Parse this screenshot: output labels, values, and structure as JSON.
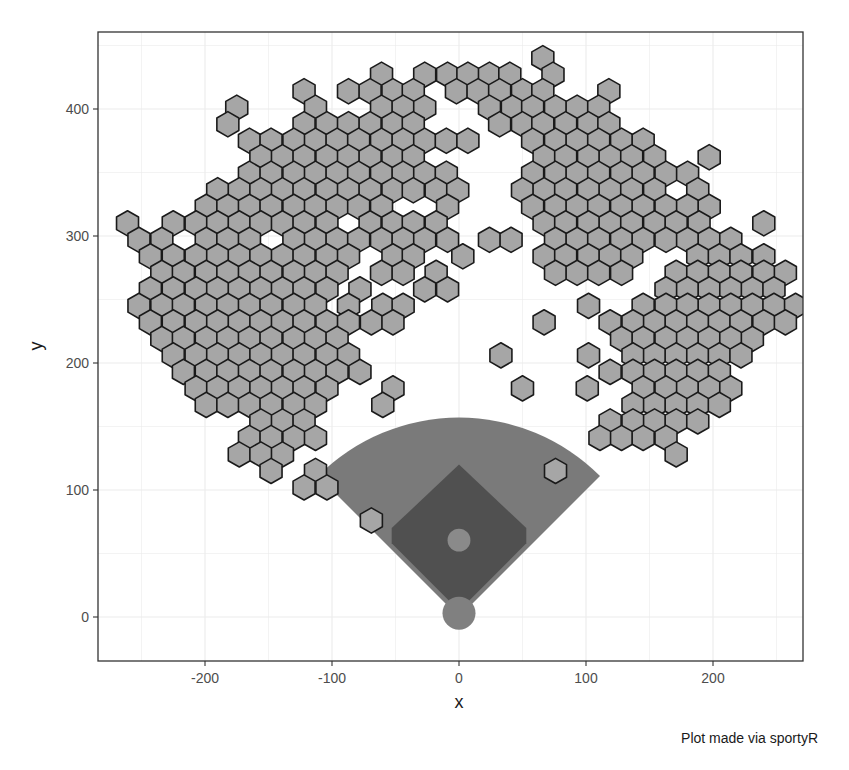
{
  "chart_data": {
    "type": "heatmap",
    "subtype": "hexbin-spray-chart",
    "title": "",
    "xlabel": "x",
    "ylabel": "y",
    "caption": "Plot made via sportyR",
    "xlim": [
      -280,
      275
    ],
    "ylim": [
      -33,
      462
    ],
    "x_ticks": [
      -200,
      -100,
      0,
      100,
      200
    ],
    "x_tick_labels": [
      "-200",
      "-100",
      "0",
      "100",
      "200"
    ],
    "y_ticks": [
      0,
      100,
      200,
      300,
      400
    ],
    "y_tick_labels": [
      "0",
      "100",
      "200",
      "300",
      "400"
    ],
    "grid": true,
    "legend": "none",
    "hex_fill": "#a6a6a6",
    "hex_stroke": "#1a1a1a",
    "field": {
      "outfield_grass_color": "#7a7a7a",
      "infield_dirt_color": "#505050",
      "mound_color": "#8a8a8a",
      "home_plate_circle_color": "#808080"
    },
    "hex_rows": [
      {
        "y": 440,
        "x": [
          66
        ]
      },
      {
        "y": 427,
        "x": [
          -61,
          -27,
          -9,
          7,
          24,
          40,
          74
        ]
      },
      {
        "y": 414,
        "x": [
          -122,
          -87,
          -70,
          -52,
          -36,
          -2,
          15,
          32,
          50,
          66,
          118
        ]
      },
      {
        "y": 401,
        "x": [
          -175,
          -113,
          -61,
          -44,
          -27,
          24,
          42,
          58,
          76,
          93,
          110
        ]
      },
      {
        "y": 388,
        "x": [
          -182,
          -122,
          -104,
          -87,
          -70,
          -52,
          -36,
          32,
          50,
          66,
          84,
          102,
          118
        ]
      },
      {
        "y": 375,
        "x": [
          -165,
          -148,
          -130,
          -113,
          -96,
          -79,
          -61,
          -44,
          -27,
          -10,
          7,
          58,
          76,
          93,
          110,
          128,
          145
        ]
      },
      {
        "y": 362,
        "x": [
          -156,
          -139,
          -122,
          -104,
          -87,
          -70,
          -52,
          -36,
          67,
          84,
          102,
          119,
          136,
          154,
          197
        ]
      },
      {
        "y": 349,
        "x": [
          -165,
          -148,
          -130,
          -113,
          -96,
          -79,
          -61,
          -44,
          -27,
          -10,
          58,
          76,
          93,
          110,
          128,
          145,
          163,
          180
        ]
      },
      {
        "y": 336,
        "x": [
          -190,
          -173,
          -156,
          -139,
          -122,
          -104,
          -87,
          -70,
          -52,
          -36,
          -18,
          -1,
          50,
          67,
          84,
          102,
          119,
          136,
          154,
          188
        ]
      },
      {
        "y": 323,
        "x": [
          -199,
          -182,
          -165,
          -148,
          -130,
          -113,
          -96,
          -79,
          -61,
          -9,
          58,
          76,
          93,
          110,
          128,
          145,
          163,
          180,
          197
        ]
      },
      {
        "y": 310,
        "x": [
          -261,
          -225,
          -207,
          -190,
          -173,
          -156,
          -139,
          -122,
          -104,
          -70,
          -52,
          -36,
          -18,
          67,
          84,
          102,
          119,
          136,
          154,
          171,
          189,
          240
        ]
      },
      {
        "y": 297,
        "x": [
          -252,
          -234,
          -199,
          -182,
          -165,
          -130,
          -113,
          -96,
          -79,
          -61,
          -44,
          -27,
          -9,
          24,
          41,
          76,
          93,
          110,
          128,
          145,
          163,
          180,
          197,
          214
        ]
      },
      {
        "y": 284,
        "x": [
          -243,
          -225,
          -207,
          -190,
          -173,
          -156,
          -139,
          -122,
          -104,
          -87,
          -52,
          -36,
          3,
          67,
          84,
          102,
          119,
          136,
          188,
          205,
          222,
          240
        ]
      },
      {
        "y": 271,
        "x": [
          -234,
          -217,
          -199,
          -182,
          -165,
          -148,
          -130,
          -113,
          -96,
          -61,
          -44,
          -18,
          76,
          93,
          110,
          128,
          171,
          188,
          205,
          222,
          240,
          257
        ]
      },
      {
        "y": 258,
        "x": [
          -243,
          -225,
          -207,
          -190,
          -173,
          -156,
          -139,
          -122,
          -104,
          -78,
          -27,
          -9,
          163,
          180,
          197,
          214,
          231,
          248
        ]
      },
      {
        "y": 245,
        "x": [
          -252,
          -234,
          -217,
          -199,
          -182,
          -165,
          -148,
          -130,
          -113,
          -87,
          -60,
          -44,
          102,
          145,
          163,
          180,
          197,
          214,
          231,
          248,
          265
        ]
      },
      {
        "y": 232,
        "x": [
          -243,
          -225,
          -207,
          -190,
          -173,
          -156,
          -139,
          -122,
          -104,
          -87,
          -69,
          -52,
          67,
          119,
          137,
          154,
          171,
          188,
          205,
          222,
          240,
          257
        ]
      },
      {
        "y": 219,
        "x": [
          -234,
          -217,
          -199,
          -182,
          -165,
          -148,
          -130,
          -113,
          -96,
          128,
          145,
          163,
          180,
          197,
          214,
          231
        ]
      },
      {
        "y": 206,
        "x": [
          -225,
          -207,
          -190,
          -173,
          -156,
          -139,
          -122,
          -104,
          -87,
          33,
          102,
          137,
          154,
          171,
          188,
          205,
          222
        ]
      },
      {
        "y": 193,
        "x": [
          -217,
          -199,
          -182,
          -165,
          -148,
          -130,
          -113,
          -96,
          -78,
          119,
          137,
          154,
          171,
          188,
          205
        ]
      },
      {
        "y": 180,
        "x": [
          -207,
          -190,
          -173,
          -156,
          -139,
          -122,
          -104,
          -52,
          50,
          101,
          145,
          163,
          180,
          197,
          214
        ]
      },
      {
        "y": 167,
        "x": [
          -199,
          -182,
          -165,
          -148,
          -130,
          -113,
          -60,
          137,
          154,
          171,
          188,
          205
        ]
      },
      {
        "y": 154,
        "x": [
          -156,
          -139,
          -122,
          119,
          137,
          154,
          171,
          188
        ]
      },
      {
        "y": 141,
        "x": [
          -165,
          -148,
          -130,
          -113,
          111,
          128,
          145,
          163
        ]
      },
      {
        "y": 128,
        "x": [
          -173,
          -156,
          -139,
          171
        ]
      },
      {
        "y": 115,
        "x": [
          -148,
          -113,
          76
        ]
      },
      {
        "y": 102,
        "x": [
          -122,
          -104
        ]
      },
      {
        "y": 76,
        "x": [
          -69
        ]
      }
    ]
  }
}
